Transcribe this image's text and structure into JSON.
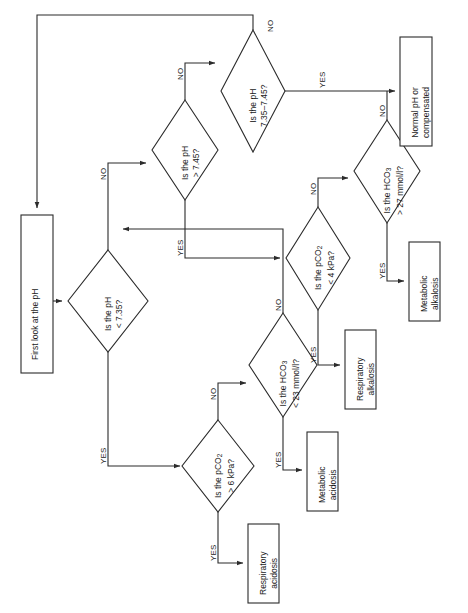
{
  "diagram": {
    "type": "flowchart",
    "orientation": "rotated-90-ccw",
    "title_present": false,
    "nodes": {
      "start": {
        "shape": "rectangle",
        "label_line1": "First look at the pH",
        "label_line2": ""
      },
      "ph_low": {
        "shape": "diamond",
        "label_line1": "Is the pH",
        "label_line2": "< 7.35?"
      },
      "ph_high": {
        "shape": "diamond",
        "label_line1": "Is the pH",
        "label_line2": "> 7.45?"
      },
      "ph_normal": {
        "shape": "diamond",
        "label_line1": "Is the pH",
        "label_line2": "7.35–7.45?"
      },
      "pco2_high": {
        "shape": "diamond",
        "label_line1": "Is the pCO",
        "label_sub1": "2",
        "label_line2": "> 6 kPa?"
      },
      "hco3_low": {
        "shape": "diamond",
        "label_line1": "Is the HCO",
        "label_sub1": "3",
        "label_line2": "< 23 mmol/l?"
      },
      "pco2_low": {
        "shape": "diamond",
        "label_line1": "Is the pCO",
        "label_sub1": "2",
        "label_line2": "< 4 kPa?"
      },
      "hco3_high": {
        "shape": "diamond",
        "label_line1": "Is the HCO",
        "label_sub1": "3",
        "label_line2": "> 27 mmol/l?"
      },
      "normal_or_comp": {
        "shape": "rectangle",
        "label_line1": "Normal pH or",
        "label_line2": "compensated"
      },
      "metabolic_alkalosis": {
        "shape": "rectangle",
        "label_line1": "Metabolic",
        "label_line2": "alkalosis"
      },
      "respiratory_alkalosis": {
        "shape": "rectangle",
        "label_line1": "Respiratory",
        "label_line2": "alkalosis"
      },
      "metabolic_acidosis": {
        "shape": "rectangle",
        "label_line1": "Metabolic",
        "label_line2": "acidosis"
      },
      "respiratory_acidosis": {
        "shape": "rectangle",
        "label_line1": "Respiratory",
        "label_line2": "acidosis"
      }
    },
    "branch_labels": {
      "ph_low_yes": "YES",
      "ph_low_no": "NO",
      "ph_high_yes": "YES",
      "ph_high_no": "NO",
      "ph_normal_yes": "YES",
      "ph_normal_no": "NO",
      "pco2_high_yes": "YES",
      "pco2_high_no": "NO",
      "hco3_low_yes": "YES",
      "hco3_low_no": "NO",
      "pco2_low_yes": "YES",
      "pco2_low_no": "NO",
      "hco3_high_yes": "YES",
      "hco3_high_no": "NO"
    },
    "colors": {
      "stroke": "#2b2b2b",
      "fill": "#ffffff",
      "text": "#1a1a1a"
    }
  }
}
